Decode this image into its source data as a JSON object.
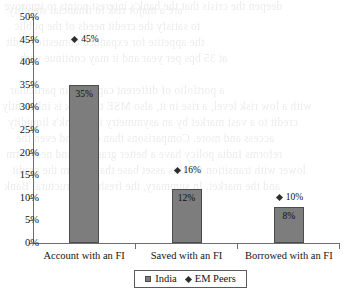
{
  "chart_data": {
    "type": "bar",
    "title": "",
    "xlabel": "",
    "ylabel": "",
    "ylim": [
      0,
      50
    ],
    "ytick_step": 5,
    "grid": false,
    "legend_position": "bottom",
    "categories": [
      "Account with an FI",
      "Saved with an FI",
      "Borrowed with an FI"
    ],
    "series": [
      {
        "name": "India",
        "marker": "bar",
        "values": [
          35,
          12,
          8
        ],
        "labels": [
          "35%",
          "12%",
          "8%"
        ],
        "color": "#7d7d7d"
      },
      {
        "name": "EM Peers",
        "marker": "diamond",
        "values": [
          45,
          16,
          10
        ],
        "labels": [
          "45%",
          "16%",
          "10%"
        ],
        "color": "#2e2e2e"
      }
    ],
    "ytick_labels": [
      "50%",
      "45%",
      "40%",
      "35%",
      "30%",
      "25%",
      "20%",
      "15%",
      "10%",
      "5%",
      "0%"
    ],
    "ytick_values": [
      50,
      45,
      40,
      35,
      30,
      25,
      20,
      15,
      10,
      5,
      0
    ]
  },
  "legend": {
    "entries": [
      {
        "label": "India",
        "symbol": "square-swatch"
      },
      {
        "label": "EM Peers",
        "symbol": "diamond-swatch"
      }
    ]
  },
  "bleed_through": {
    "lines": [
      "are a major risk to financial stability",
      "to satisfy the credit needs of the public",
      "the appetite for expanded domestic credit",
      "at 35 bps per year and it may continue with",
      "deepen the crisis that the bank's interest points to improve",
      "a portfolio of different capacity, in particular",
      "with a low risk level, a rise in it, also MSE this risk is inherently",
      "credit to a vast market by an asymmetry in a bank's liquidity",
      "access and more. Comparisons than ever and even the",
      "reforms India policy have a better grasp behind near-term",
      "lower with transition for this asset base that system the credit",
      "and the market. In summary, the fresh the structural Bank"
    ]
  }
}
